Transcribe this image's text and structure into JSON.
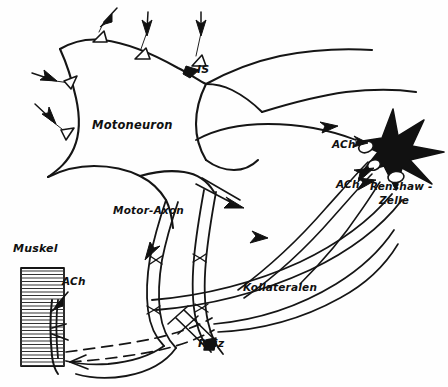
{
  "figure": {
    "language": "de",
    "background_color": "#fefefe",
    "ink_color": "#111111",
    "labels": {
      "motoneuron": "Motoneuron",
      "initial_segment": "IS",
      "motor_axon": "Motor-Axon",
      "kollateralen": "Kollateralen",
      "renshaw_cell": "Renshaw -\nZelle",
      "renshaw_cell_line1": "Renshaw -",
      "renshaw_cell_line2": "Zelle",
      "ach_upper": "ACh",
      "ach_lower": "ACh",
      "ach_muscle": "ACh",
      "muskel": "Muskel",
      "reiz": "Reiz"
    },
    "label_positions": {
      "motoneuron": {
        "x": 92,
        "y": 129
      },
      "initial_segment": {
        "x": 197,
        "y": 73
      },
      "motor_axon": {
        "x": 113,
        "y": 214
      },
      "kollateralen": {
        "x": 243,
        "y": 291
      },
      "renshaw_cell_line1": {
        "x": 370,
        "y": 190
      },
      "renshaw_cell_line2": {
        "x": 379,
        "y": 204
      },
      "ach_upper": {
        "x": 332,
        "y": 148
      },
      "ach_lower": {
        "x": 336,
        "y": 188
      },
      "ach_muscle": {
        "x": 62,
        "y": 285
      },
      "muskel": {
        "x": 13,
        "y": 252
      },
      "reiz": {
        "x": 198,
        "y": 347
      }
    },
    "elements": {
      "synaptic_boutons_count": 5,
      "input_arrows_count": 5,
      "flow_arrows_count": 5,
      "renshaw_shape": "black-star",
      "muscle_shape": "striated-rectangle",
      "muscle_striations": 28,
      "stimulus_electrode": "crossed-bar-electrode",
      "afferent_feedback": "dashed-line"
    }
  }
}
